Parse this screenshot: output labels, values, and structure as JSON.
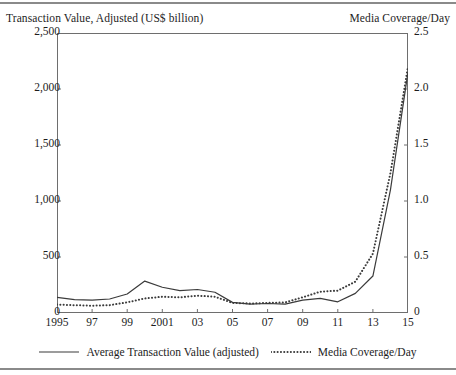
{
  "figure": {
    "left_axis_title": "Transaction Value, Adjusted (US$ billion)",
    "right_axis_title": "Media Coverage/Day"
  },
  "legend": {
    "items": [
      {
        "label": "Average Transaction Value (adjusted)",
        "style": "solid",
        "color": "#3b3b3b"
      },
      {
        "label": "Media Coverage/Day",
        "style": "dotted",
        "color": "#3b3b3b"
      }
    ]
  },
  "axes": {
    "y_left_ticks": [
      "0",
      "500",
      "1,000",
      "1,500",
      "2,000",
      "2,500"
    ],
    "y_right_ticks": [
      "0",
      "0.5",
      "1.0",
      "1.5",
      "2.0",
      "2.5"
    ],
    "x_ticks": [
      "1995",
      "97",
      "99",
      "2001",
      "03",
      "05",
      "07",
      "09",
      "11",
      "13",
      "15"
    ]
  },
  "chart_data": {
    "type": "line",
    "title": "",
    "xlabel": "",
    "ylabel": "Transaction Value, Adjusted (US$ billion)",
    "y2label": "Media Coverage/Day",
    "xlim": [
      1995,
      2015
    ],
    "ylim": [
      0,
      2500
    ],
    "y2lim": [
      0,
      2.5
    ],
    "grid": false,
    "legend_position": "bottom",
    "x": [
      1995,
      1996,
      1997,
      1998,
      1999,
      2000,
      2001,
      2002,
      2003,
      2004,
      2005,
      2006,
      2007,
      2008,
      2009,
      2010,
      2011,
      2012,
      2013,
      2014,
      2015
    ],
    "series": [
      {
        "name": "Average Transaction Value (adjusted)",
        "axis": "left",
        "style": "solid",
        "values": [
          140,
          120,
          115,
          125,
          170,
          285,
          230,
          200,
          210,
          185,
          95,
          80,
          85,
          80,
          115,
          130,
          100,
          175,
          330,
          1100,
          2150
        ]
      },
      {
        "name": "Media Coverage/Day",
        "axis": "right",
        "style": "dotted",
        "values": [
          0.075,
          0.07,
          0.065,
          0.07,
          0.095,
          0.13,
          0.145,
          0.14,
          0.155,
          0.145,
          0.09,
          0.085,
          0.09,
          0.095,
          0.14,
          0.19,
          0.2,
          0.28,
          0.53,
          1.25,
          2.2
        ]
      }
    ]
  }
}
